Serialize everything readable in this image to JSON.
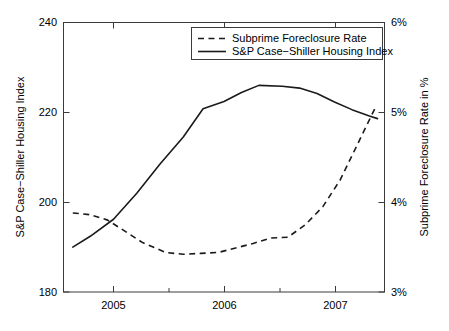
{
  "chart_data": {
    "type": "line",
    "title": "",
    "xlabel": "",
    "ylabel": "S&P Case−Shiller Housing Index",
    "y2label": "Subprime Foreclosure Rate in %",
    "grid": false,
    "legend_position": "top-center",
    "xlim": [
      2004.62,
      2007.38
    ],
    "ylim": [
      180,
      240
    ],
    "y2lim": [
      3,
      6
    ],
    "xticks": [
      2005,
      2006,
      2007
    ],
    "xticklabels": [
      "2005",
      "2006",
      "2007"
    ],
    "xminorticks": [
      2004.75,
      2005.25,
      2005.5,
      2005.75,
      2006.25,
      2006.5,
      2006.75,
      2007.25
    ],
    "yticks": [
      180,
      200,
      220,
      240
    ],
    "yticklabels": [
      "180",
      "200",
      "220",
      "240"
    ],
    "y2ticks": [
      3,
      4,
      5,
      6
    ],
    "y2ticklabels": [
      "3%",
      "4%",
      "5%",
      "6%"
    ],
    "series": [
      {
        "name": "Subprime Foreclosure Rate",
        "axis": "right",
        "style": "dashed",
        "color": "#1a1a1a",
        "x": [
          2004.7,
          2004.85,
          2005.0,
          2005.12,
          2005.3,
          2005.5,
          2005.65,
          2005.8,
          2005.95,
          2006.1,
          2006.25,
          2006.4,
          2006.55,
          2006.7,
          2006.85,
          2007.0,
          2007.15,
          2007.3
        ],
        "values": [
          3.88,
          3.86,
          3.8,
          3.7,
          3.55,
          3.44,
          3.42,
          3.43,
          3.44,
          3.49,
          3.54,
          3.6,
          3.61,
          3.75,
          3.95,
          4.25,
          4.65,
          5.05
        ]
      },
      {
        "name": "S&P Case−Shiller Housing Index",
        "axis": "left",
        "style": "solid",
        "color": "#1a1a1a",
        "x": [
          2004.7,
          2004.85,
          2005.05,
          2005.25,
          2005.45,
          2005.65,
          2005.82,
          2006.0,
          2006.15,
          2006.3,
          2006.5,
          2006.65,
          2006.8,
          2006.95,
          2007.1,
          2007.25,
          2007.32
        ],
        "values": [
          190.0,
          192.4,
          196.2,
          202.0,
          208.5,
          214.5,
          220.8,
          222.4,
          224.4,
          226.0,
          225.8,
          225.4,
          224.2,
          222.3,
          220.6,
          219.2,
          218.6
        ]
      }
    ],
    "legend": [
      {
        "label": "Subprime Foreclosure Rate",
        "style": "dashed"
      },
      {
        "label": "S&P Case−Shiller Housing Index",
        "style": "solid"
      }
    ]
  }
}
